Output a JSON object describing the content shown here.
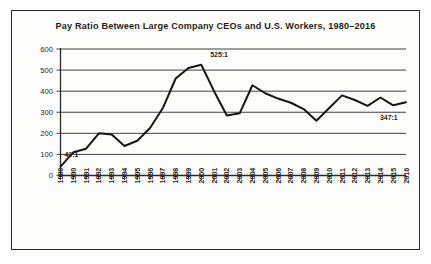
{
  "chart_data": {
    "type": "line",
    "title": "Pay Ratio Between Large Company CEOs and U.S. Workers, 1980–2016",
    "xlabel": "",
    "ylabel": "",
    "ylim": [
      0,
      600
    ],
    "ytick_labels": [
      "0",
      "100",
      "200",
      "300",
      "400",
      "500",
      "600"
    ],
    "ytick_values": [
      0,
      100,
      200,
      300,
      400,
      500,
      600
    ],
    "grid": true,
    "legend": null,
    "categories": [
      "1980",
      "1990",
      "1991",
      "1992",
      "1993",
      "1994",
      "1995",
      "1996",
      "1997",
      "1998",
      "1999",
      "2000",
      "2001",
      "2002",
      "2003",
      "2004",
      "2005",
      "2006",
      "2007",
      "2008",
      "2009",
      "2010",
      "2011",
      "2012",
      "2013",
      "2014",
      "2015",
      "2016"
    ],
    "values": [
      42,
      110,
      127,
      200,
      195,
      140,
      165,
      225,
      320,
      460,
      510,
      525,
      400,
      285,
      295,
      428,
      390,
      365,
      345,
      315,
      260,
      320,
      380,
      358,
      330,
      370,
      333,
      347
    ],
    "annotations": [
      {
        "text": "42:1",
        "category": "1980",
        "value": 42
      },
      {
        "text": "525:1",
        "category": "2000",
        "value": 525
      },
      {
        "text": "347:1",
        "category": "2016",
        "value": 347
      }
    ]
  }
}
